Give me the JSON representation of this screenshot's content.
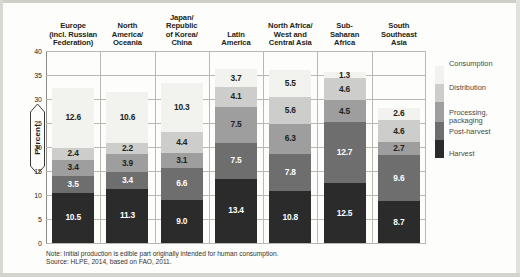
{
  "chart_data": {
    "type": "bar",
    "stacked": true,
    "title": "",
    "xlabel": "",
    "ylabel": "Percent",
    "ylim": [
      0,
      40
    ],
    "ytick_labels": [
      "0",
      "5",
      "10",
      "15",
      "20",
      "25",
      "30",
      "35",
      "40"
    ],
    "ytick_values": [
      0,
      5,
      10,
      15,
      20,
      25,
      30,
      35,
      40
    ],
    "grid": true,
    "legend_position": "right",
    "categories": [
      "Europe\n(incl. Russian\nFederation)",
      "North\nAmerica/\nOceania",
      "Japan/\nRepublic\nof Korea/\nChina",
      "Latin\nAmerica",
      "North Africa/\nWest and\nCentral Asia",
      "Sub-\nSaharan\nAfrica",
      "South\nSoutheast\nAsia"
    ],
    "series": [
      {
        "name": "Harvest",
        "color": "#2b2b2b",
        "label_color": "#ffffff",
        "values": [
          10.5,
          11.3,
          9.0,
          13.4,
          10.8,
          12.5,
          8.7
        ],
        "labels": [
          "10.5",
          "11.3",
          "9.0",
          "13.4",
          "10.8",
          "12.5",
          "8.7"
        ]
      },
      {
        "name": "Post-harvest",
        "color": "#6e6e6e",
        "label_color": "#ffffff",
        "values": [
          3.5,
          3.4,
          6.6,
          7.5,
          7.8,
          12.7,
          9.6
        ],
        "labels": [
          "3.5",
          "3.4",
          "6.6",
          "7.5",
          "7.8",
          "12.7",
          "9.6"
        ]
      },
      {
        "name": "Processing,\npackaging",
        "color": "#9e9e9e",
        "label_color": "#231f20",
        "values": [
          3.4,
          3.9,
          3.1,
          7.5,
          6.3,
          4.5,
          2.7
        ],
        "labels": [
          "3.4",
          "3.9",
          "3.1",
          "7.5",
          "6.3",
          "4.5",
          "2.7"
        ]
      },
      {
        "name": "Distribution",
        "color": "#cdcdcb",
        "label_color": "#231f20",
        "values": [
          2.4,
          2.2,
          4.4,
          4.1,
          5.6,
          4.6,
          4.6
        ],
        "labels": [
          "2.4",
          "2.2",
          "4.4",
          "4.1",
          "5.6",
          "4.6",
          "4.6"
        ]
      },
      {
        "name": "Consumption",
        "color": "#f2f2ef",
        "label_color": "#231f20",
        "values": [
          12.6,
          10.6,
          10.3,
          3.7,
          5.5,
          1.3,
          2.6
        ],
        "labels": [
          "12.6",
          "10.6",
          "10.3",
          "3.7",
          "5.5",
          "1.3",
          "2.6"
        ]
      }
    ],
    "legend": [
      {
        "label": "Consumption",
        "color": "#f2f2ef"
      },
      {
        "label": "Distribution",
        "color": "#cdcdcb"
      },
      {
        "label": "Processing,\npackaging",
        "color": "#9e9e9e"
      },
      {
        "label": "Post-harvest",
        "color": "#6e6e6e"
      },
      {
        "label": "Harvest",
        "color": "#2b2b2b"
      }
    ]
  },
  "notes": {
    "note": "Note: Initial production is edible part originally intended for human consumption.",
    "source": "Source: HLPE, 2014, based on FAO, 2011."
  }
}
